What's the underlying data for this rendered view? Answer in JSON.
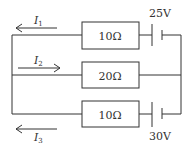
{
  "diagram": {
    "type": "circuit",
    "stroke_color": "#333333",
    "branches": [
      {
        "id": "top",
        "resistor": "10Ω",
        "battery": "25V",
        "current": {
          "symbol": "I",
          "subscript": "1",
          "direction": "left"
        }
      },
      {
        "id": "middle",
        "resistor": "20Ω",
        "current": {
          "symbol": "I",
          "subscript": "2",
          "direction": "right"
        }
      },
      {
        "id": "bottom",
        "resistor": "10Ω",
        "battery": "30V",
        "current": {
          "symbol": "I",
          "subscript": "3",
          "direction": "left"
        }
      }
    ]
  }
}
